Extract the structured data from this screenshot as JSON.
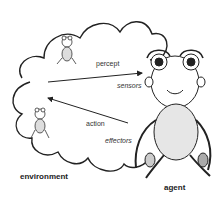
{
  "diagram": {
    "labels": {
      "percept": "percept",
      "sensors": "sensors",
      "action": "action",
      "effectors": "effectors",
      "environment": "environment",
      "agent": "agent"
    },
    "nodes": [
      {
        "id": "environment",
        "label": "environment",
        "shape": "cloud"
      },
      {
        "id": "agent",
        "label": "agent",
        "shape": "creature"
      }
    ],
    "edges": [
      {
        "from": "environment",
        "to": "agent",
        "label": "percept",
        "endpoint": "sensors"
      },
      {
        "from": "agent",
        "to": "environment",
        "label": "action",
        "endpoint": "effectors"
      }
    ],
    "colors": {
      "line": "#222222",
      "background": "#ffffff"
    }
  }
}
